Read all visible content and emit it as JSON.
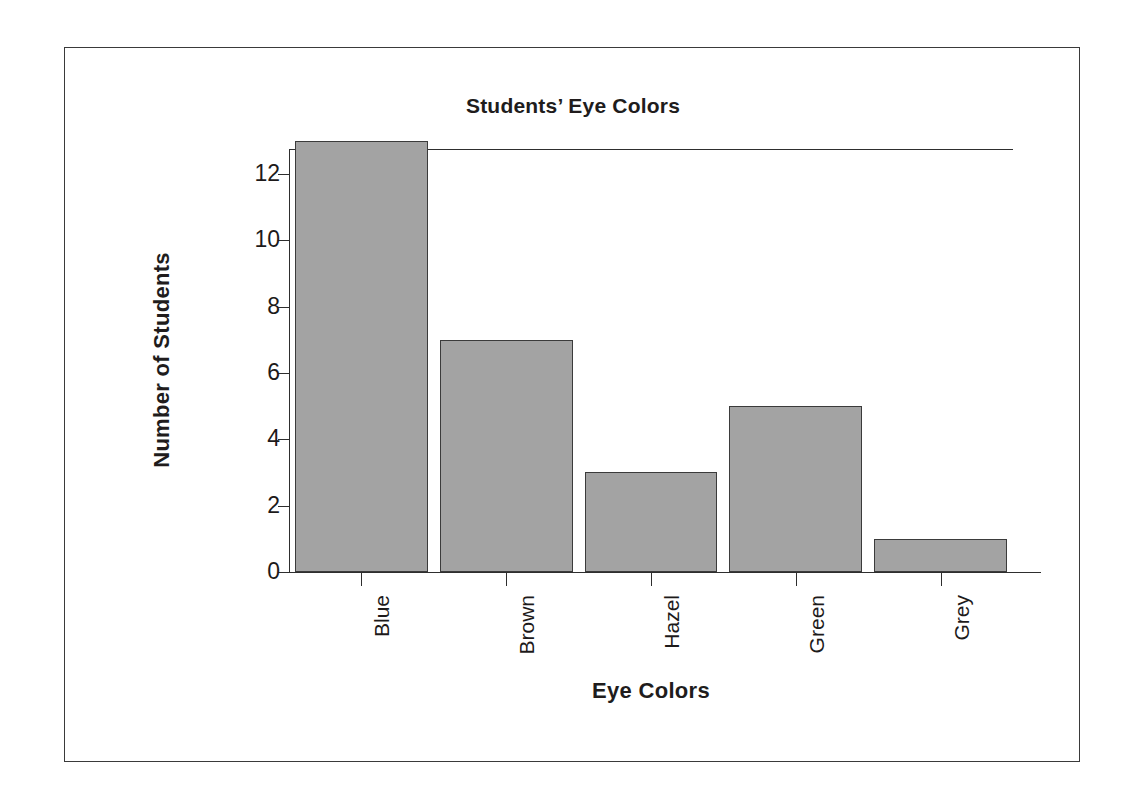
{
  "chart_data": {
    "type": "bar",
    "title": "Students’ Eye Colors",
    "xlabel": "Eye Colors",
    "ylabel": "Number of Students",
    "categories": [
      "Blue",
      "Brown",
      "Hazel",
      "Green",
      "Grey"
    ],
    "values": [
      13,
      7,
      3,
      5,
      1
    ],
    "yticks": [
      0,
      2,
      4,
      6,
      8,
      10,
      12
    ],
    "ylim": [
      0,
      12.75
    ],
    "grid": false,
    "legend": null,
    "bar_color": "#a3a3a3",
    "bar_edge_color": "#3b3b3b",
    "axis_color": "#2e2e2e",
    "background_color": "#ffffff",
    "frame_color": "#3a3a3a"
  },
  "axis": {
    "y_tick_labels": [
      "12",
      "10",
      "8",
      "6",
      "4",
      "2",
      "0"
    ],
    "x_tick_labels": [
      "Blue",
      "Brown",
      "Hazel",
      "Green",
      "Grey"
    ]
  }
}
